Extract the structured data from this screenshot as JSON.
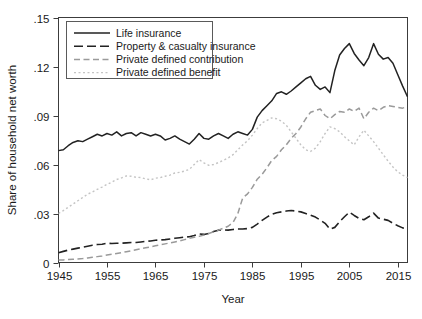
{
  "chart_data": {
    "type": "line",
    "title": "",
    "xlabel": "Year",
    "ylabel": "Share of household net worth",
    "xlim": [
      1945,
      2017
    ],
    "ylim": [
      0,
      0.15
    ],
    "grid": false,
    "legend_position": "top-left",
    "xticks": [
      1945,
      1955,
      1965,
      1975,
      1985,
      1995,
      2005,
      2015
    ],
    "xtick_labels": [
      "1945",
      "1955",
      "1965",
      "1975",
      "1985",
      "1995",
      "2005",
      "2015"
    ],
    "yticks": [
      0,
      0.03,
      0.06,
      0.09,
      0.12,
      0.15
    ],
    "ytick_labels": [
      "0",
      ".03",
      ".06",
      ".09",
      ".12",
      ".15"
    ],
    "x": [
      1945,
      1946,
      1947,
      1948,
      1949,
      1950,
      1951,
      1952,
      1953,
      1954,
      1955,
      1956,
      1957,
      1958,
      1959,
      1960,
      1961,
      1962,
      1963,
      1964,
      1965,
      1966,
      1967,
      1968,
      1969,
      1970,
      1971,
      1972,
      1973,
      1974,
      1975,
      1976,
      1977,
      1978,
      1979,
      1980,
      1981,
      1982,
      1983,
      1984,
      1985,
      1986,
      1987,
      1988,
      1989,
      1990,
      1991,
      1992,
      1993,
      1994,
      1995,
      1996,
      1997,
      1998,
      1999,
      2000,
      2001,
      2002,
      2003,
      2004,
      2005,
      2006,
      2007,
      2008,
      2009,
      2010,
      2011,
      2012,
      2013,
      2014,
      2015,
      2016,
      2017
    ],
    "series": [
      {
        "name": "Life insurance",
        "style": "solid",
        "color": "#222222",
        "width": 1.5,
        "values": [
          0.0685,
          0.069,
          0.0715,
          0.0735,
          0.0745,
          0.074,
          0.0755,
          0.077,
          0.0785,
          0.0775,
          0.079,
          0.078,
          0.08,
          0.0775,
          0.079,
          0.0795,
          0.0775,
          0.0795,
          0.0785,
          0.0775,
          0.0785,
          0.0775,
          0.075,
          0.076,
          0.0775,
          0.0755,
          0.074,
          0.0725,
          0.0755,
          0.079,
          0.076,
          0.0755,
          0.0775,
          0.079,
          0.0775,
          0.076,
          0.0785,
          0.08,
          0.079,
          0.078,
          0.0815,
          0.089,
          0.093,
          0.096,
          0.099,
          0.1035,
          0.1045,
          0.103,
          0.105,
          0.1075,
          0.11,
          0.1125,
          0.114,
          0.1085,
          0.106,
          0.1075,
          0.104,
          0.1175,
          0.127,
          0.131,
          0.134,
          0.128,
          0.124,
          0.1205,
          0.1255,
          0.134,
          0.1275,
          0.1245,
          0.1255,
          0.122,
          0.115,
          0.108,
          0.1015
        ]
      },
      {
        "name": "Property & casualty insurance",
        "style": "dashed",
        "color": "#222222",
        "width": 1.6,
        "values": [
          0.006,
          0.0068,
          0.0076,
          0.0082,
          0.0088,
          0.0094,
          0.01,
          0.0106,
          0.011,
          0.0112,
          0.0118,
          0.0116,
          0.0118,
          0.0118,
          0.012,
          0.0122,
          0.0122,
          0.0126,
          0.013,
          0.0132,
          0.0136,
          0.0138,
          0.014,
          0.0144,
          0.0148,
          0.0152,
          0.0156,
          0.0158,
          0.0165,
          0.0175,
          0.0172,
          0.0178,
          0.019,
          0.0198,
          0.02,
          0.0198,
          0.0202,
          0.0205,
          0.0205,
          0.0208,
          0.0215,
          0.0235,
          0.0258,
          0.0278,
          0.0295,
          0.0305,
          0.031,
          0.0315,
          0.0318,
          0.0315,
          0.031,
          0.03,
          0.029,
          0.0278,
          0.026,
          0.024,
          0.0205,
          0.0215,
          0.025,
          0.028,
          0.0308,
          0.0288,
          0.027,
          0.0262,
          0.028,
          0.0302,
          0.0272,
          0.0265,
          0.0258,
          0.024,
          0.0225,
          0.0212,
          0.0205
        ]
      },
      {
        "name": "Private defined contribution",
        "style": "dashed-light",
        "color": "#9a9a9a",
        "width": 1.5,
        "values": [
          0.0015,
          0.0016,
          0.0018,
          0.002,
          0.0022,
          0.0024,
          0.0028,
          0.0032,
          0.0036,
          0.004,
          0.0046,
          0.005,
          0.0055,
          0.006,
          0.0066,
          0.0072,
          0.0078,
          0.0084,
          0.009,
          0.0096,
          0.0102,
          0.0108,
          0.0114,
          0.012,
          0.0126,
          0.0132,
          0.014,
          0.0148,
          0.0155,
          0.016,
          0.0168,
          0.0178,
          0.0188,
          0.0198,
          0.021,
          0.0222,
          0.0245,
          0.03,
          0.0395,
          0.042,
          0.046,
          0.051,
          0.054,
          0.058,
          0.0625,
          0.065,
          0.069,
          0.072,
          0.076,
          0.079,
          0.083,
          0.088,
          0.092,
          0.093,
          0.094,
          0.09,
          0.088,
          0.0905,
          0.0925,
          0.092,
          0.094,
          0.0925,
          0.0945,
          0.088,
          0.092,
          0.0945,
          0.093,
          0.095,
          0.096,
          0.0955,
          0.095,
          0.0945,
          0.0955
        ]
      },
      {
        "name": "Private defined benefit",
        "style": "dotted",
        "color": "#c4c4c4",
        "width": 1.4,
        "values": [
          0.03,
          0.0318,
          0.0338,
          0.0358,
          0.0378,
          0.0398,
          0.0418,
          0.0432,
          0.0448,
          0.0462,
          0.0478,
          0.0492,
          0.0508,
          0.0518,
          0.053,
          0.0528,
          0.0522,
          0.052,
          0.0512,
          0.0506,
          0.0516,
          0.052,
          0.0528,
          0.0535,
          0.0548,
          0.0552,
          0.056,
          0.057,
          0.06,
          0.063,
          0.061,
          0.0595,
          0.06,
          0.0612,
          0.0625,
          0.064,
          0.066,
          0.069,
          0.072,
          0.0745,
          0.078,
          0.082,
          0.0855,
          0.087,
          0.0885,
          0.088,
          0.0865,
          0.084,
          0.08,
          0.076,
          0.072,
          0.069,
          0.068,
          0.07,
          0.074,
          0.079,
          0.083,
          0.082,
          0.08,
          0.077,
          0.0745,
          0.072,
          0.077,
          0.081,
          0.0775,
          0.074,
          0.07,
          0.066,
          0.062,
          0.0585,
          0.0555,
          0.0535,
          0.052
        ]
      }
    ]
  },
  "legend": {
    "entries": [
      {
        "label": "Life insurance"
      },
      {
        "label": "Property & casualty insurance"
      },
      {
        "label": "Private defined contribution"
      },
      {
        "label": "Private defined benefit"
      }
    ]
  },
  "axes": {
    "y_title": "Share of household net worth",
    "x_title": "Year"
  }
}
